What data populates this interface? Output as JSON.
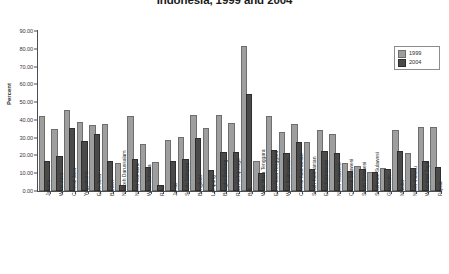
{
  "chart_data": {
    "type": "bar",
    "title": "Indonesia, 1999 and 2004",
    "xlabel": "",
    "ylabel": "Percent",
    "ylim": [
      0,
      90
    ],
    "ytick_step": 10,
    "ytick_labels": [
      "0.00",
      "10.00",
      "20.00",
      "30.00",
      "40.00",
      "50.00",
      "60.00",
      "70.00",
      "80.00",
      "90.00"
    ],
    "grid": false,
    "legend_position": "top-right",
    "categories": [
      "Jakarta",
      "West Java",
      "Central Java",
      "Yogyakarta",
      "East Java",
      "Banten",
      "N. Aceh Darussalam",
      "North Sumatra",
      "West Sumatra",
      "Riau",
      "Jambi",
      "South Sumatra",
      "Bengkulu",
      "Lampung",
      "Bangka Belitung",
      "Riau Archipelago",
      "Bali",
      "West Nusa Tenggara",
      "East Nusa Tenggara",
      "West Kalimantan",
      "Central Kalimantan",
      "South Kalimantan",
      "East Kalimantan",
      "North Sulawesi",
      "Central Sulawesi",
      "South Sulawesi",
      "Southeast Sulawesi",
      "Gorontalo",
      "Maluku",
      "North Maluku",
      "West Irian Jaya",
      "Papua"
    ],
    "series": [
      {
        "name": "1999",
        "color": "#9e9e9e",
        "values": [
          41.0,
          34.0,
          44.5,
          37.5,
          36.0,
          36.5,
          14.5,
          41.0,
          25.5,
          15.0,
          27.5,
          29.0,
          41.5,
          34.5,
          41.5,
          37.0,
          80.5,
          15.5,
          41.0,
          32.0,
          36.5,
          26.5,
          33.0,
          31.0,
          14.5,
          13.0,
          9.5,
          12.0,
          33.0,
          20.0,
          35.0,
          35.0
        ]
      },
      {
        "name": "2004",
        "color": "#4a4a4a",
        "values": [
          15.5,
          18.5,
          34.5,
          27.0,
          31.0,
          15.5,
          2.0,
          17.0,
          12.5,
          2.0,
          16.0,
          17.0,
          28.5,
          10.5,
          21.0,
          21.0,
          53.5,
          9.0,
          22.0,
          20.0,
          26.5,
          11.5,
          21.5,
          20.5,
          10.0,
          11.5,
          9.5,
          11.5,
          21.5,
          12.0,
          16.0,
          12.5
        ]
      }
    ]
  },
  "legend": {
    "items": [
      {
        "label": "1999"
      },
      {
        "label": "2004"
      }
    ]
  }
}
